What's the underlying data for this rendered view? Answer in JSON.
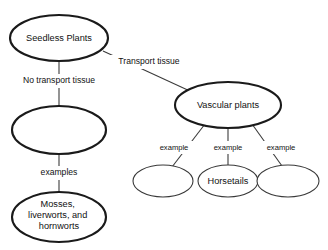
{
  "diagram": {
    "type": "concept-map",
    "background_color": "#ffffff",
    "stroke_color": "#1a1a1a",
    "text_color": "#111111",
    "nodes": [
      {
        "id": "seedless-plants",
        "label": "Seedless Plants",
        "shape": "ellipse",
        "cx": 59,
        "cy": 38,
        "rx": 49,
        "ry": 23,
        "weight": "major",
        "empty": false
      },
      {
        "id": "nonvascular-plants",
        "label": "",
        "shape": "ellipse",
        "cx": 59,
        "cy": 130,
        "rx": 47,
        "ry": 24,
        "weight": "major",
        "empty": true
      },
      {
        "id": "mosses-liverworts-hornworts",
        "label": "Mosses, liverworts, and hornworts",
        "label_lines": [
          "Mosses,",
          "liverworts, and",
          "hornworts"
        ],
        "shape": "ellipse",
        "cx": 59,
        "cy": 217,
        "rx": 47,
        "ry": 25,
        "weight": "major",
        "empty": false
      },
      {
        "id": "vascular-plants",
        "label": "Vascular plants",
        "shape": "ellipse",
        "cx": 228,
        "cy": 105,
        "rx": 53,
        "ry": 23,
        "weight": "major",
        "empty": false
      },
      {
        "id": "example-left",
        "label": "",
        "shape": "ellipse",
        "cx": 163,
        "cy": 181,
        "rx": 30,
        "ry": 16,
        "weight": "minor",
        "empty": true
      },
      {
        "id": "horsetails",
        "label": "Horsetails",
        "shape": "ellipse",
        "cx": 228,
        "cy": 181,
        "rx": 30,
        "ry": 16,
        "weight": "minor",
        "empty": false
      },
      {
        "id": "example-right",
        "label": "",
        "shape": "ellipse",
        "cx": 288,
        "cy": 181,
        "rx": 31,
        "ry": 16,
        "weight": "minor",
        "empty": true
      }
    ],
    "edges": [
      {
        "id": "edge-seedless-to-nonvascular",
        "from": "seedless-plants",
        "to": "nonvascular-plants",
        "label": "No transport tissue",
        "label_x": 59,
        "label_y": 81
      },
      {
        "id": "edge-seedless-to-vascular",
        "from": "seedless-plants",
        "to": "vascular-plants",
        "label": "Transport tissue",
        "label_x": 149,
        "label_y": 62
      },
      {
        "id": "edge-nonvascular-to-mosses",
        "from": "nonvascular-plants",
        "to": "mosses-liverworts-hornworts",
        "label": "examples",
        "label_x": 59,
        "label_y": 173
      },
      {
        "id": "edge-vascular-to-example-left",
        "from": "vascular-plants",
        "to": "example-left",
        "label": "example",
        "label_x": 174,
        "label_y": 148
      },
      {
        "id": "edge-vascular-to-horsetails",
        "from": "vascular-plants",
        "to": "horsetails",
        "label": "example",
        "label_x": 228,
        "label_y": 148
      },
      {
        "id": "edge-vascular-to-example-right",
        "from": "vascular-plants",
        "to": "example-right",
        "label": "example",
        "label_x": 281,
        "label_y": 148
      }
    ]
  }
}
